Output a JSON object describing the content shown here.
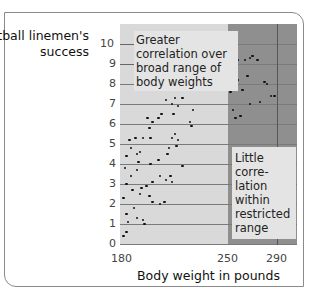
{
  "chart_data": {
    "type": "scatter",
    "title": "",
    "ylabel": "Football linemen's success",
    "xlabel": "Body weight in pounds",
    "x_ticks": [
      180,
      250,
      290
    ],
    "y_ticks": [
      0,
      1,
      2,
      3,
      4,
      5,
      6,
      7,
      8,
      9,
      10
    ],
    "xlim": [
      180,
      302
    ],
    "ylim": [
      0,
      10
    ],
    "grid": true,
    "shaded_region": {
      "x_from": 250,
      "x_to": 302,
      "color": "#8f8f8f"
    },
    "annotations": [
      {
        "text": "Greater correlation over broad range of body weights",
        "region": "upper-left"
      },
      {
        "text": "Little correlation within restricted range",
        "region": "right"
      }
    ],
    "points": [
      [
        181,
        0.4
      ],
      [
        183,
        0.6
      ],
      [
        184,
        1.1
      ],
      [
        183,
        1.5
      ],
      [
        181,
        2.3
      ],
      [
        190,
        1.3
      ],
      [
        194,
        1.2
      ],
      [
        195,
        1.0
      ],
      [
        188,
        1.8
      ],
      [
        183,
        3.0
      ],
      [
        186,
        3.4
      ],
      [
        190,
        3.7
      ],
      [
        191,
        4.1
      ],
      [
        187,
        2.7
      ],
      [
        192,
        2.5
      ],
      [
        193,
        2.8
      ],
      [
        196,
        2.9
      ],
      [
        198,
        2.4
      ],
      [
        200,
        3.1
      ],
      [
        200,
        2.1
      ],
      [
        205,
        2.0
      ],
      [
        208,
        2.1
      ],
      [
        205,
        3.4
      ],
      [
        209,
        3.2
      ],
      [
        212,
        3.4
      ],
      [
        213,
        3.1
      ],
      [
        182,
        3.8
      ],
      [
        183,
        4.4
      ],
      [
        185,
        5.2
      ],
      [
        186,
        4.8
      ],
      [
        189,
        5.3
      ],
      [
        190,
        4.5
      ],
      [
        192,
        4.6
      ],
      [
        194,
        5.3
      ],
      [
        199,
        4.0
      ],
      [
        204,
        4.2
      ],
      [
        210,
        4.5
      ],
      [
        211,
        4.8
      ],
      [
        213,
        5.3
      ],
      [
        215,
        5.5
      ],
      [
        216,
        4.9
      ],
      [
        217,
        5.2
      ],
      [
        220,
        3.9
      ],
      [
        197,
        6.3
      ],
      [
        198,
        5.8
      ],
      [
        199,
        5.3
      ],
      [
        200,
        6.1
      ],
      [
        204,
        6.3
      ],
      [
        206,
        6.5
      ],
      [
        209,
        7.2
      ],
      [
        213,
        7.0
      ],
      [
        214,
        6.5
      ],
      [
        215,
        7.3
      ],
      [
        217,
        6.9
      ],
      [
        218,
        7.9
      ],
      [
        220,
        7.3
      ],
      [
        221,
        8.0
      ],
      [
        222,
        8.1
      ],
      [
        225,
        6.1
      ],
      [
        227,
        6.7
      ],
      [
        226,
        5.9
      ],
      [
        229,
        7.8
      ],
      [
        230,
        8.3
      ],
      [
        232,
        8.7
      ],
      [
        252,
        8.7
      ],
      [
        258,
        9.2
      ],
      [
        264,
        9.2
      ],
      [
        268,
        9.3
      ],
      [
        270,
        9.4
      ],
      [
        274,
        9.2
      ],
      [
        256,
        8.8
      ],
      [
        258,
        8.2
      ],
      [
        266,
        8.4
      ],
      [
        280,
        8.1
      ],
      [
        252,
        7.6
      ],
      [
        262,
        7.7
      ],
      [
        268,
        7.0
      ],
      [
        276,
        7.1
      ],
      [
        285,
        7.4
      ],
      [
        288,
        7.4
      ],
      [
        254,
        6.7
      ],
      [
        260,
        6.4
      ],
      [
        256,
        6.3
      ],
      [
        282,
        8.0
      ]
    ]
  },
  "labels": {
    "ylabel": "Football linemen's success",
    "xlabel": "Body weight in pounds",
    "note_broad": "Greater correlation over broad range of body weights",
    "note_restricted": "Little corre-lation within restricted range"
  }
}
